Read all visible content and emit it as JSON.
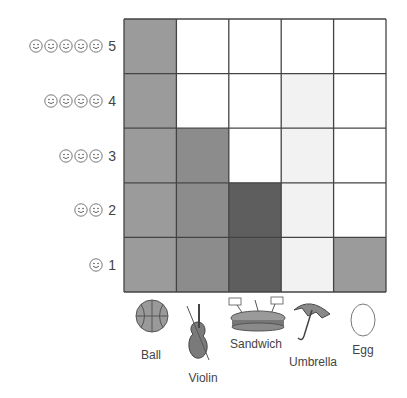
{
  "chart_data": {
    "type": "bar",
    "title": "",
    "xlabel": "",
    "ylabel": "",
    "categories": [
      "Ball",
      "Violin",
      "Sandwich",
      "Umbrella",
      "Egg"
    ],
    "values": [
      5,
      3,
      2,
      4,
      1
    ],
    "ylim": [
      0,
      5
    ],
    "y_ticks": [
      "1",
      "2",
      "3",
      "4",
      "5"
    ],
    "y_tick_icon": "smiley-face-icon",
    "grid": true,
    "bar_colors": [
      "#9b9b9b",
      "#8c8c8c",
      "#5e5e5e",
      "#f2f2f2",
      "#9b9b9b"
    ],
    "category_icons": [
      "ball-icon",
      "violin-icon",
      "sandwich-icon",
      "umbrella-icon",
      "egg-icon"
    ]
  }
}
